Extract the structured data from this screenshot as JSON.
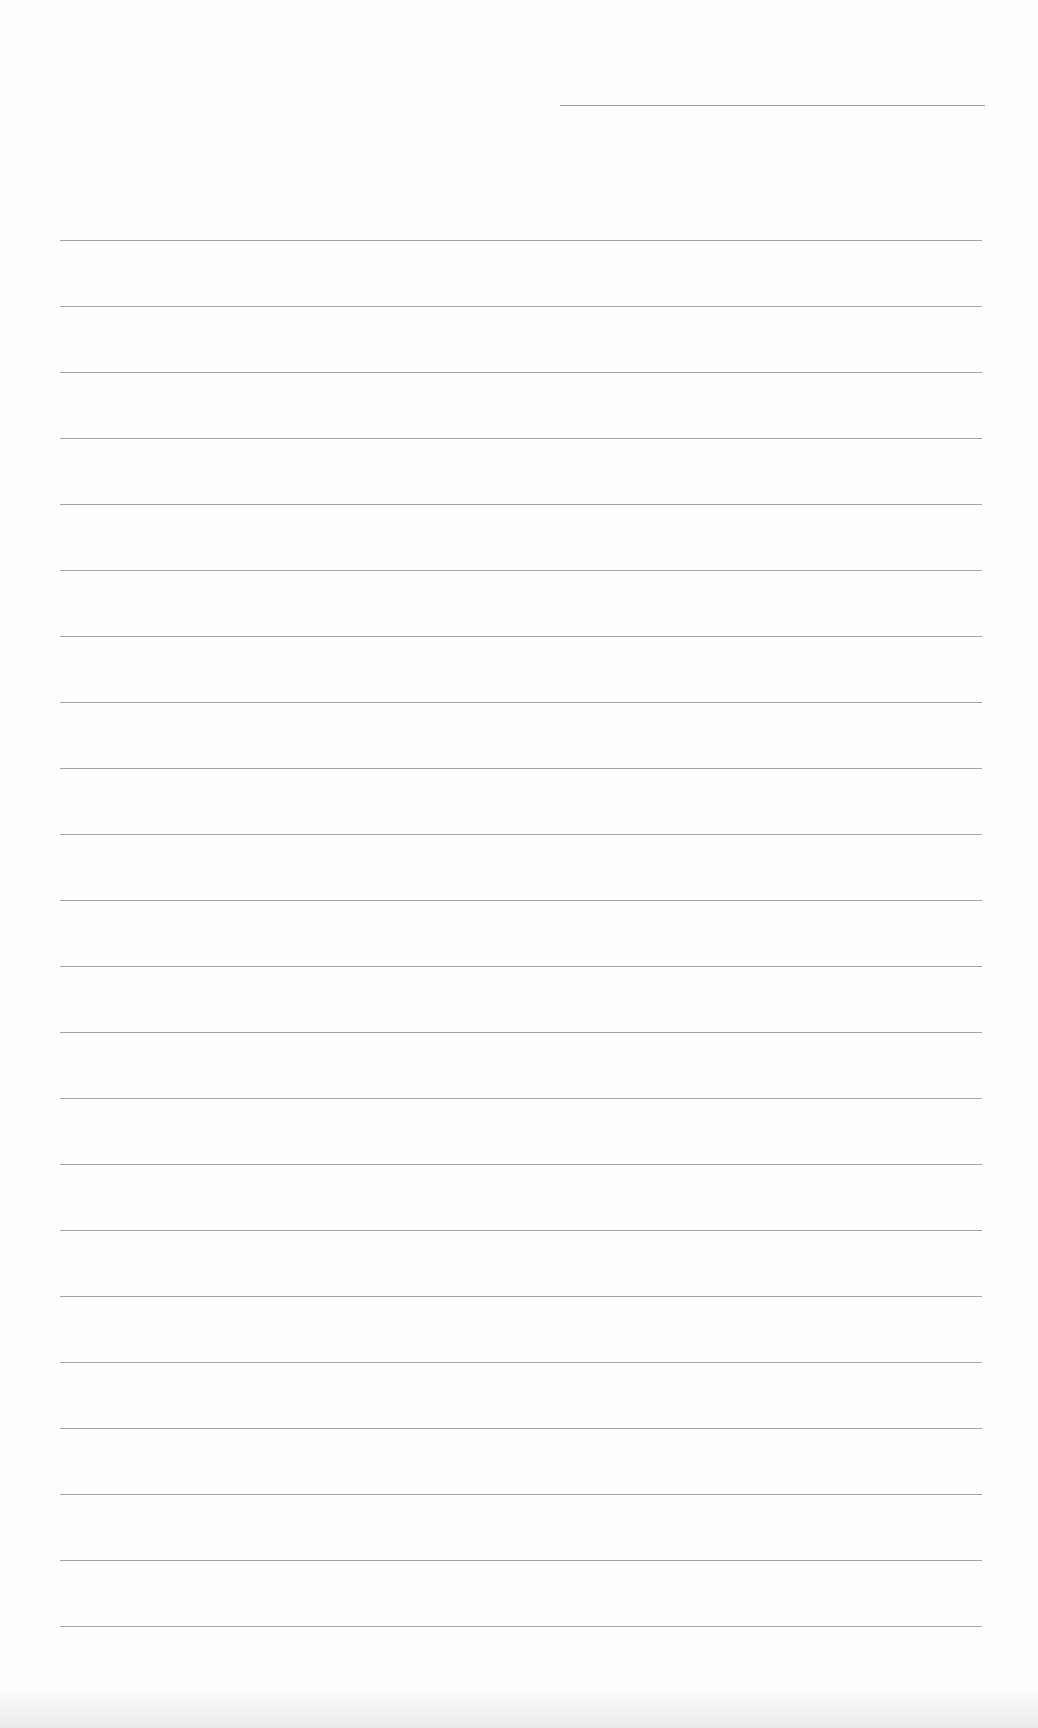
{
  "page": {
    "type": "lined-paper",
    "background_color": "#fefefe",
    "line_color": "#a4a4a4",
    "header_line": {
      "present": true,
      "position": "top-right"
    },
    "rule_count": 22,
    "text": ""
  }
}
